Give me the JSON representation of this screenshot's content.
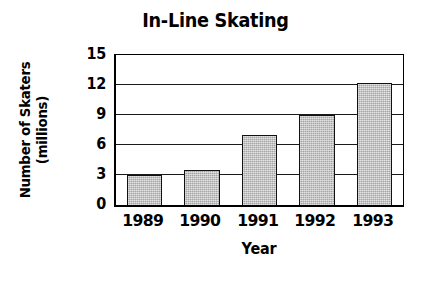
{
  "chart_data": {
    "type": "bar",
    "title": "In-Line Skating",
    "xlabel": "Year",
    "ylabel": "Number of Skaters (millions)",
    "ylabel_lines": [
      "Number of Skaters",
      "(millions)"
    ],
    "categories": [
      "1989",
      "1990",
      "1991",
      "1992",
      "1993"
    ],
    "values": [
      3.0,
      3.5,
      7.0,
      9.0,
      12.2
    ],
    "series": [
      {
        "name": "Number of Skaters (millions)",
        "values": [
          3.0,
          3.5,
          7.0,
          9.0,
          12.2
        ]
      }
    ],
    "ylim": [
      0,
      15
    ],
    "yticks": [
      0,
      3,
      6,
      9,
      12,
      15
    ],
    "ytick_labels": [
      "0",
      "3",
      "6",
      "9",
      "12",
      "15"
    ],
    "grid": "horizontal",
    "legend": "none",
    "bar_fill_color": "#b9b9b9",
    "bar_edge_color": "#111111",
    "axis_color": "#000000",
    "background_color": "#ffffff"
  }
}
